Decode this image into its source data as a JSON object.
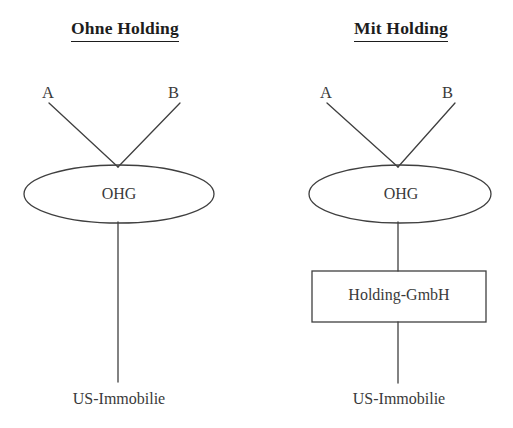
{
  "figure": {
    "type": "diagram",
    "background_color": "#ffffff",
    "stroke_color": "#3a3a3a",
    "text_color": "#3a3a3a"
  },
  "panels": [
    {
      "id": "ohne-holding",
      "title": "Ohne Holding",
      "partners": [
        {
          "id": "a",
          "label": "A"
        },
        {
          "id": "b",
          "label": "B"
        }
      ],
      "entity": {
        "shape": "ellipse",
        "label": "OHG"
      },
      "asset": {
        "label": "US-Immobilie"
      },
      "intermediate": null
    },
    {
      "id": "mit-holding",
      "title": "Mit Holding",
      "partners": [
        {
          "id": "a",
          "label": "A"
        },
        {
          "id": "b",
          "label": "B"
        }
      ],
      "entity": {
        "shape": "ellipse",
        "label": "OHG"
      },
      "intermediate": {
        "shape": "rectangle",
        "label": "Holding-GmbH"
      },
      "asset": {
        "label": "US-Immobilie"
      }
    }
  ]
}
